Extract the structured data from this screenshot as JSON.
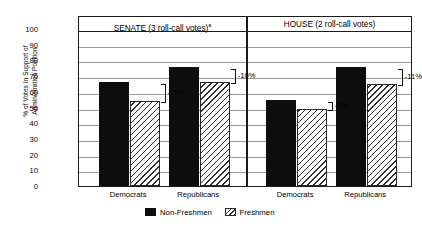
{
  "chart_data": {
    "type": "bar",
    "title": "",
    "xlabel": "",
    "ylabel_line1": "% of Votes In Support of",
    "ylabel_line2": "Administration Position",
    "ylim": [
      0,
      100
    ],
    "yticks": [
      100,
      90,
      80,
      70,
      60,
      50,
      40,
      30,
      20,
      10,
      0
    ],
    "grid": true,
    "legend_position": "bottom-center",
    "categories": [
      "Democrats",
      "Republicans",
      "Democrats",
      "Republicans"
    ],
    "panels": [
      {
        "label": "SENATE (3 roll-call votes)",
        "footnote_marker": "a",
        "categories": [
          "Democrats",
          "Republicans"
        ]
      },
      {
        "label": "HOUSE (2 roll-call votes)",
        "footnote_marker": "",
        "categories": [
          "Democrats",
          "Republicans"
        ]
      }
    ],
    "series": [
      {
        "name": "Non-Freshmen",
        "values": [
          66,
          76,
          55,
          76
        ]
      },
      {
        "name": "Freshmen",
        "values": [
          54,
          66,
          49,
          65
        ]
      }
    ],
    "annotations": [
      "-12%",
      "-10%",
      "-6%",
      "-11%"
    ]
  },
  "legend": {
    "items": [
      {
        "label": "Non-Freshmen",
        "style": "solid-black"
      },
      {
        "label": "Freshmen",
        "style": "diagonal-hatch"
      }
    ]
  }
}
